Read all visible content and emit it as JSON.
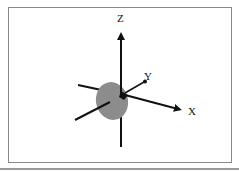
{
  "diagram": {
    "type": "3d-coordinate-axes",
    "axes": [
      {
        "name": "Z",
        "label": "Z",
        "direction": "up"
      },
      {
        "name": "X",
        "label": "X",
        "direction": "right-down"
      },
      {
        "name": "Y",
        "label": "Y",
        "direction": "up-right (into page)"
      }
    ],
    "object": {
      "shape": "ellipse",
      "color": "#8c8c8c",
      "description": "grey disk at origin"
    },
    "colors": {
      "axis": "#111111",
      "frame": "#8a8a8a",
      "disk": "#8c8c8c"
    }
  }
}
